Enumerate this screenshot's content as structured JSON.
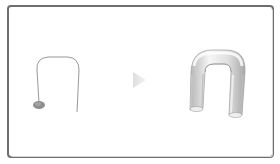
{
  "diagram": {
    "title": "",
    "frame": {
      "border_color": "#6e6e6e",
      "background": "#ffffff"
    },
    "left_panel": {
      "label": "path-with-profile",
      "path_color": "#8c8c8c",
      "profile_ellipse_color": "#8a8a8a"
    },
    "arrow": {
      "direction": "right",
      "color": "#e6e6e6"
    },
    "right_panel": {
      "label": "extruded-tube",
      "tube_fill_light": "#f5f5f5",
      "tube_fill_dark": "#b8b8b8",
      "tube_outline": "#a0a0a0"
    }
  }
}
